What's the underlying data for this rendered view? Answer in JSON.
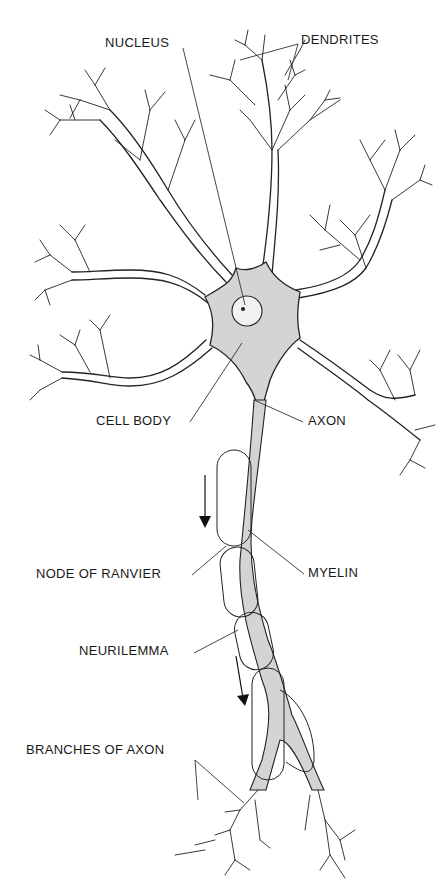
{
  "diagram": {
    "labels": {
      "nucleus": "NUCLEUS",
      "dendrites": "DENDRITES",
      "cell_body": "CELL BODY",
      "axon": "AXON",
      "node_of_ranvier": "NODE OF RANVIER",
      "myelin": "MYELIN",
      "neurilemma": "NEURILEMMA",
      "branches_of_axon": "BRANCHES OF AXON"
    },
    "colors": {
      "ink": "#222222",
      "cell_fill": "#d4d4d4",
      "nucleus_fill": "#f2f2f2",
      "background": "#ffffff"
    },
    "arrows": [
      {
        "direction": "down",
        "meaning": "impulse direction"
      },
      {
        "direction": "down",
        "meaning": "impulse direction"
      }
    ]
  }
}
